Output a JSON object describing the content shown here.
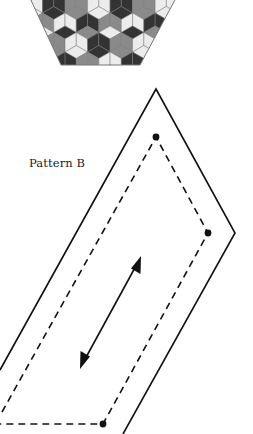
{
  "figure": {
    "pattern_label": "Pattern B",
    "colors": {
      "line": "#111111",
      "tile_dark": "#333333",
      "tile_mid": "#8a8a8a",
      "tile_light": "#ececec",
      "tile_outline": "#777777"
    },
    "components": [
      "hexagon-quilt-preview",
      "outer-diamond-outline",
      "inner-dashed-seam",
      "corner-dots",
      "grain-direction-arrow"
    ]
  }
}
